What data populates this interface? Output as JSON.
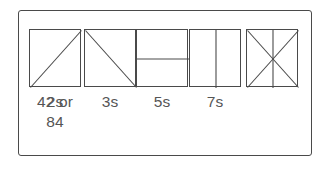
{
  "figure": {
    "border_color": "#4a4a4a",
    "line_color": "#4a4a4a",
    "label_color": "#555555",
    "background_color": "#ffffff",
    "cells": [
      {
        "id": "cell-2s",
        "label": "2s",
        "pattern": "diagonal-up",
        "pattern_description": "square divided by one diagonal from bottom-left to top-right"
      },
      {
        "id": "cell-3s",
        "label": "3s",
        "pattern": "diagonal-down",
        "pattern_description": "square divided by one diagonal from top-left to bottom-right"
      },
      {
        "id": "cell-5s",
        "label": "5s",
        "pattern": "horizontal-split",
        "pattern_description": "square divided by one horizontal line through the middle"
      },
      {
        "id": "cell-7s",
        "label": "7s",
        "pattern": "vertical-split",
        "pattern_description": "square divided by one vertical line through the middle"
      },
      {
        "id": "cell-42-or-84",
        "label": "42 or\n84",
        "pattern": "x-plus-vertical",
        "pattern_description": "square divided by both diagonals and one vertical line through the middle"
      }
    ]
  }
}
